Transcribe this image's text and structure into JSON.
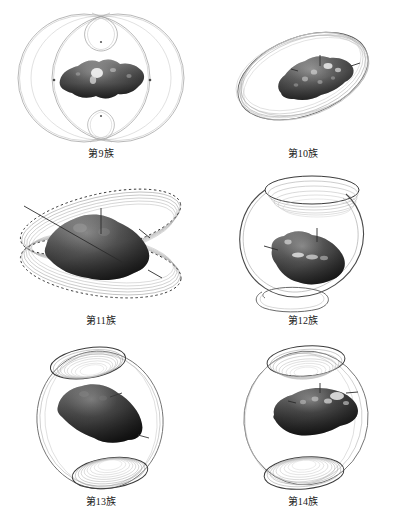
{
  "figure": {
    "background_color": "#ffffff",
    "layout": "2-columns-by-3-rows",
    "panel_count": 6
  },
  "panels": [
    {
      "id": "panel-9",
      "caption": "第9族",
      "family_number": 9,
      "orbit_description": "two large overlapping near-circular rings seen edge-on, with a small teardrop loop above and below the body",
      "body_description": "dark grey irregular elongated asteroid with bright highlight patches",
      "marker_dots": 2,
      "small_loops": 2,
      "line_color": "#8d8d8d",
      "body_color": "#3a3a3a"
    },
    {
      "id": "panel-10",
      "caption": "第10族",
      "family_number": 10,
      "orbit_description": "bundle of tilted near-circular orbits forming an inclined ellipse around the body",
      "body_description": "dark grey irregular elongated asteroid with bright highlight patches and spin-axis tick marks",
      "marker_dots": 0,
      "small_loops": 0,
      "line_color": "#8d8d8d",
      "body_color": "#4a4a4a"
    },
    {
      "id": "panel-11",
      "caption": "第11族",
      "family_number": 11,
      "orbit_description": "two crossing bands of stacked orbits, upper and lower, drawn with dotted point markers along the rings",
      "body_description": "large dark grey irregular asteroid filling the centre",
      "marker_dots": 72,
      "small_loops": 0,
      "line_color": "#6e6e6e",
      "body_color": "#3a3a3a"
    },
    {
      "id": "panel-12",
      "caption": "第12族",
      "family_number": 12,
      "orbit_description": "large open halo loop descending into a small crossing loop beneath the body, with a stacked ring cap at the top",
      "body_description": "dark grey irregular asteroid tilted nose-down with bright highlight band",
      "marker_dots": 0,
      "small_loops": 1,
      "line_color": "#7a7a7a",
      "body_color": "#3a3a3a"
    },
    {
      "id": "panel-13",
      "caption": "第13族",
      "family_number": 13,
      "orbit_description": "spherical shell of orbits with nested spiral caps at the top and bottom poles",
      "body_description": "very dark irregular asteroid seen broadside",
      "marker_dots": 0,
      "small_loops": 0,
      "line_color": "#7a7a7a",
      "body_color": "#2f2f2f"
    },
    {
      "id": "panel-14",
      "caption": "第14族",
      "family_number": 14,
      "orbit_description": "spherical shell of orbits with nested spiral caps at top and bottom, outer ring offset to the right",
      "body_description": "very dark irregular asteroid with bright highlight patches on the upper surface",
      "marker_dots": 0,
      "small_loops": 0,
      "line_color": "#7a7a7a",
      "body_color": "#2f2f2f"
    }
  ]
}
